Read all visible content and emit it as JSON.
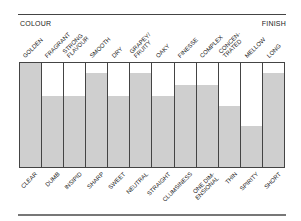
{
  "header": {
    "left_label": "COLOUR",
    "right_label": "FINISH"
  },
  "chart_data": {
    "type": "bar",
    "title": "",
    "top_labels": [
      "GOLDEN",
      "FRAGRANT",
      "STRONG\nFLAVOUR",
      "SMOOTH",
      "DRY",
      "GRAPEY/\nFRUITY",
      "OAKY",
      "FINESSE",
      "COMPLEX",
      "CONCEN-\nTRATED",
      "MELLOW",
      "LONG"
    ],
    "bottom_labels": [
      "CLEAR",
      "DUMB",
      "INSIPID",
      "SHARP",
      "SWEET",
      "NEUTRAL",
      "STRAIGHT",
      "CLUMSINESS",
      "ONE DIM-\nENSIONAL",
      "THIN",
      "SPIRITY",
      "SHORT"
    ],
    "values": [
      100,
      68,
      68,
      90,
      68,
      90,
      68,
      79,
      79,
      59,
      39,
      90
    ],
    "ylim": [
      0,
      100
    ],
    "grid": false,
    "legend": "none",
    "colors": {
      "fill": "#cfcfcf",
      "border": "#444444",
      "background": "#ffffff"
    }
  }
}
